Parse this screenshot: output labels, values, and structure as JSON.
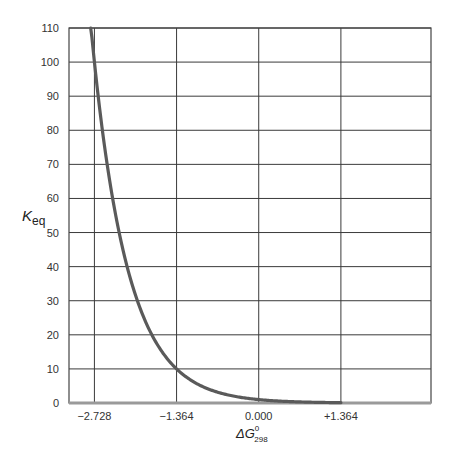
{
  "chart_data": {
    "type": "line",
    "title": "",
    "xlabel": "ΔG°298",
    "xlabel_parts": {
      "base": "ΔG",
      "sup": "0",
      "sub": "298"
    },
    "ylabel": "Keq",
    "ylabel_parts": {
      "base": "K",
      "sub": "eq"
    },
    "x_ticks": [
      -2.728,
      -1.364,
      0.0,
      1.364
    ],
    "x_tick_labels": [
      "−2.728",
      "−1.364",
      "0.000",
      "+1.364"
    ],
    "y_ticks": [
      0,
      10,
      20,
      30,
      40,
      50,
      60,
      70,
      80,
      90,
      100,
      110
    ],
    "y_tick_labels": [
      "0",
      "10",
      "20",
      "30",
      "40",
      "50",
      "60",
      "70",
      "80",
      "90",
      "100",
      "110"
    ],
    "xlim": [
      -3.15,
      2.86
    ],
    "ylim": [
      0,
      110
    ],
    "grid": true,
    "legend": null,
    "series": [
      {
        "name": "Keq vs ΔG°298",
        "relation": "Keq = 10^(-ΔG/1.364)",
        "x": [
          -2.79,
          -2.728,
          -2.5,
          -2.2,
          -2.0,
          -1.8,
          -1.6,
          -1.364,
          -1.0,
          -0.7,
          -0.4,
          0.0,
          0.4,
          0.8,
          1.364
        ],
        "values": [
          110.7,
          100,
          67.8,
          41.0,
          29.2,
          20.9,
          14.9,
          10,
          5.4,
          3.26,
          1.96,
          1,
          0.51,
          0.26,
          0.1
        ]
      }
    ],
    "colors": {
      "curve": "#5a5a5a",
      "grid": "#3a3a3a",
      "baseline": "#9a9a9a"
    }
  }
}
